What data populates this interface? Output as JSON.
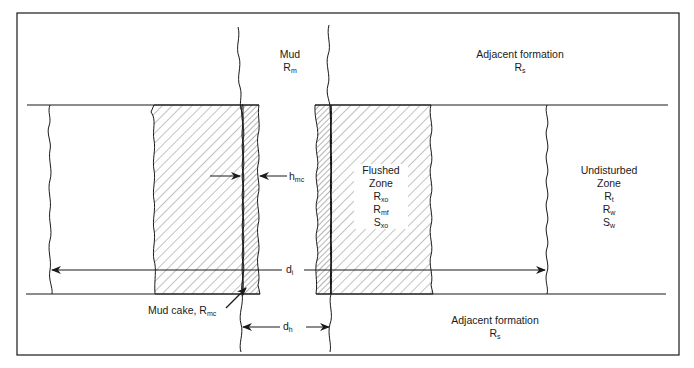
{
  "diagram": {
    "type": "borehole-invasion-profile",
    "labels": {
      "mud": {
        "title": "Mud",
        "symbol": "R",
        "sub": "m"
      },
      "adjacent_top": {
        "title": "Adjacent formation",
        "symbol": "R",
        "sub": "s"
      },
      "adjacent_bottom": {
        "title": "Adjacent formation",
        "symbol": "R",
        "sub": "s"
      },
      "flushed_zone": {
        "title": "Flushed",
        "title2": "Zone",
        "params": [
          {
            "symbol": "R",
            "sub": "xo"
          },
          {
            "symbol": "R",
            "sub": "mf"
          },
          {
            "symbol": "S",
            "sub": "xo"
          }
        ]
      },
      "undisturbed_zone": {
        "title": "Undisturbed",
        "title2": "Zone",
        "params": [
          {
            "symbol": "R",
            "sub": "t"
          },
          {
            "symbol": "R",
            "sub": "w"
          },
          {
            "symbol": "S",
            "sub": "w"
          }
        ]
      },
      "hmc": {
        "symbol": "h",
        "sub": "mc"
      },
      "mud_cake": {
        "title": "Mud cake, R",
        "sub": "mc"
      },
      "di": {
        "symbol": "d",
        "sub": "i"
      },
      "dh": {
        "symbol": "d",
        "sub": "h"
      }
    },
    "colors": {
      "line": "#1a1a1a",
      "hatch": "#555555",
      "background": "#ffffff"
    }
  }
}
